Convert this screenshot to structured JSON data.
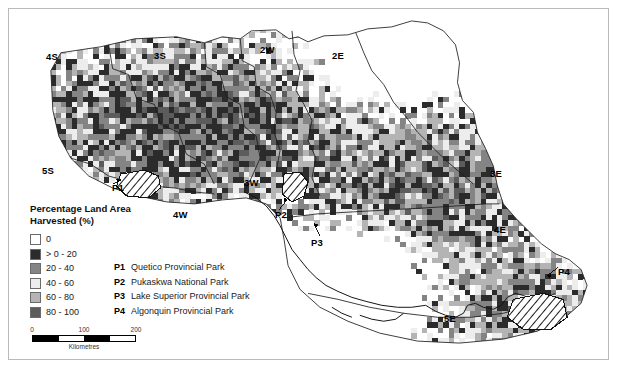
{
  "figure": {
    "width": 618,
    "height": 369,
    "background": "#ffffff",
    "frame_color": "#b9b9b9"
  },
  "legend": {
    "title": "Percentage Land Area\nHarvested (%)",
    "classes": [
      {
        "label": "0",
        "color": "#ffffff"
      },
      {
        "label": "> 0 - 20",
        "color": "#2b2b2b"
      },
      {
        "label": "20 - 40",
        "color": "#848484"
      },
      {
        "label": "40 - 60",
        "color": "#ededed"
      },
      {
        "label": "60 - 80",
        "color": "#b4b4b4"
      },
      {
        "label": "80 - 100",
        "color": "#5c5c5c"
      }
    ]
  },
  "park_key": [
    {
      "code": "P1",
      "name": "Quetico Provincial Park"
    },
    {
      "code": "P2",
      "name": "Pukaskwa National Park"
    },
    {
      "code": "P3",
      "name": "Lake Superior Provincial Park"
    },
    {
      "code": "P4",
      "name": "Algonquin Provincial Park"
    }
  ],
  "scalebar": {
    "ticks": [
      "0",
      "100",
      "200"
    ],
    "caption": "Kilometres",
    "segments": [
      "fill",
      "blank",
      "fill",
      "blank"
    ]
  },
  "map_labels": [
    {
      "id": "region-4S",
      "text": "4S",
      "x": 45,
      "y": 51
    },
    {
      "id": "region-3S",
      "text": "3S",
      "x": 153,
      "y": 50
    },
    {
      "id": "region-2W",
      "text": "2W",
      "x": 259,
      "y": 44
    },
    {
      "id": "region-2E",
      "text": "2E",
      "x": 331,
      "y": 50
    },
    {
      "id": "region-5S",
      "text": "5S",
      "x": 41,
      "y": 165
    },
    {
      "id": "region-3W",
      "text": "3W",
      "x": 243,
      "y": 177
    },
    {
      "id": "region-4W",
      "text": "4W",
      "x": 172,
      "y": 209
    },
    {
      "id": "region-3E",
      "text": "3E",
      "x": 489,
      "y": 168
    },
    {
      "id": "region-4E",
      "text": "4E",
      "x": 493,
      "y": 224
    },
    {
      "id": "region-5E",
      "text": "5E",
      "x": 443,
      "y": 313
    },
    {
      "id": "park-label-P1",
      "text": "P1",
      "x": 111,
      "y": 182
    },
    {
      "id": "park-label-P2",
      "text": "P2",
      "x": 274,
      "y": 209
    },
    {
      "id": "park-label-P3",
      "text": "P3",
      "x": 310,
      "y": 237
    },
    {
      "id": "park-label-P4",
      "text": "P4",
      "x": 557,
      "y": 266
    }
  ],
  "chart_data": {
    "type": "heatmap",
    "title": "Percentage Land Area Harvested (%)",
    "classification": "choropleth raster grid, 6 classes",
    "units": "percent of land area harvested",
    "legend_breaks": [
      0,
      20,
      40,
      60,
      80,
      100
    ],
    "regions": [
      "2W",
      "2E",
      "3S",
      "3W",
      "3E",
      "4S",
      "4W",
      "4E",
      "5S",
      "5E"
    ],
    "parks_highlighted": [
      "P1",
      "P2",
      "P3",
      "P4"
    ],
    "scale_max_km": 200
  }
}
